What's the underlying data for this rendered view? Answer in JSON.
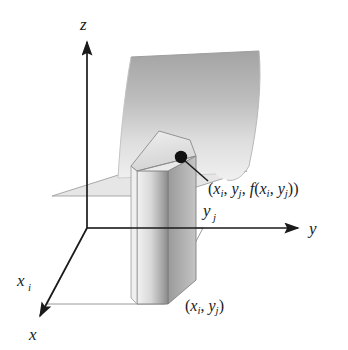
{
  "figure": {
    "background_color": "#ffffff",
    "width": 348,
    "height": 350
  },
  "axes": {
    "z_label": "z",
    "y_label": "y",
    "x_label": "x",
    "origin_px": [
      87,
      228
    ],
    "z_axis": {
      "from_px": [
        87,
        228
      ],
      "to_px": [
        87,
        38
      ],
      "arrow": "up"
    },
    "y_axis": {
      "from_px": [
        87,
        228
      ],
      "to_px": [
        305,
        228
      ],
      "arrow": "right"
    },
    "x_axis": {
      "from_px": [
        87,
        228
      ],
      "to_px": [
        37,
        322
      ],
      "arrow": "down-left"
    }
  },
  "labels": {
    "x_subscript_label": {
      "base": "x",
      "sub": "i",
      "px": [
        24,
        279
      ]
    },
    "y_subscript_label": {
      "base": "y",
      "sub": "j",
      "px": [
        205,
        210
      ]
    },
    "surface_point_label": {
      "text": "(x_i, y_j, f(x_i, y_j))",
      "parts": [
        "(",
        "x",
        "i",
        ", ",
        "y",
        "j",
        ", ",
        "f",
        "(",
        "x",
        "i",
        ", ",
        "y",
        "j",
        "))"
      ],
      "px": [
        207,
        188
      ]
    },
    "base_point_label": {
      "text": "(x_i, y_j)",
      "parts": [
        "(",
        "x",
        "i",
        ", ",
        "y",
        "j",
        ")"
      ],
      "px": [
        185,
        305
      ]
    }
  },
  "surface": {
    "name": "curved-surface-sheet",
    "description": "Curved gray sheet representing z = f(x, y)",
    "fill_top_color": "#a6a6a6",
    "fill_bottom_color": "#ededed",
    "outline_color": "#b5b5b5"
  },
  "cutting_plane": {
    "name": "horizontal-reference-plane",
    "description": "Light horizontal plane slicing through the surface",
    "fill_color": "#e4e4e4",
    "outline_color": "#9a9a9a"
  },
  "column": {
    "name": "riemann-column",
    "description": "Rectangular prism column rising from the xy-plane to the surface",
    "top_face_color": "#e3e3e3",
    "front_face_color_left": "#ededed",
    "front_face_color_right": "#8c8c8c",
    "side_face_color": "#b0b0b0",
    "outline_color": "#7d7d7d"
  },
  "marker": {
    "name": "surface-point-dot",
    "color": "#111111",
    "px": [
      181,
      157
    ],
    "radius": 6,
    "leader_line_to_px": [
      207,
      180
    ]
  },
  "grid": {
    "base_lines_color": "#9a9a9a",
    "description": "Partition grid lines in the xy-plane forming the rectangle base"
  }
}
